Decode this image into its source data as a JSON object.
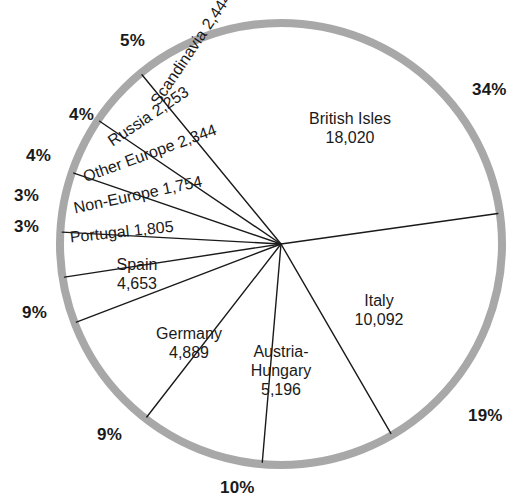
{
  "chart_data": {
    "type": "pie",
    "title": "",
    "subtitle": "",
    "xlabel": "",
    "ylabel": "",
    "total": 53450,
    "units": "count",
    "legend_position": "none",
    "grid": false,
    "categories": [
      "British Isles",
      "Italy",
      "Austria-Hungary",
      "Germany",
      "Spain",
      "Portugal",
      "Non-Europe",
      "Other Europe",
      "Russia",
      "Scandinavia"
    ],
    "values": [
      18020,
      10092,
      5196,
      4889,
      4653,
      1805,
      1754,
      2344,
      2253,
      2444
    ],
    "value_labels": [
      "18,020",
      "10,092",
      "5,196",
      "4,889",
      "4,653",
      "1,805",
      "1,754",
      "2,344",
      "2,253",
      "2,444"
    ],
    "percent_labels": [
      "34%",
      "19%",
      "10%",
      "9%",
      "9%",
      "3%",
      "3%",
      "4%",
      "4%",
      "5%"
    ],
    "percents": [
      34,
      19,
      10,
      9,
      9,
      3,
      3,
      4,
      4,
      5
    ],
    "slices": [
      {
        "name": "British Isles",
        "value": 18020,
        "value_label": "18,020",
        "percent_label": "34%",
        "label_line1": "British Isles",
        "label_line2": "18,020",
        "label_x": 350,
        "label_y": 129,
        "rotation": 0,
        "orientation": "horizontal",
        "pct_x": 472,
        "pct_y": 80,
        "start_deg": -8,
        "end_deg": -129.4
      },
      {
        "name": "Italy",
        "value": 10092,
        "value_label": "10,092",
        "percent_label": "19%",
        "label_line1": "Italy",
        "label_line2": "10,092",
        "label_x": 379,
        "label_y": 311,
        "rotation": 0,
        "orientation": "horizontal",
        "pct_x": 468,
        "pct_y": 406,
        "start_deg": 59.9,
        "end_deg": -8
      },
      {
        "name": "Austria-Hungary",
        "value": 5196,
        "value_label": "5,196",
        "percent_label": "10%",
        "label_line1": "Austria-",
        "label_line2": "Hungary",
        "label_line3": "5,196",
        "label_x": 281,
        "label_y": 371,
        "rotation": 0,
        "orientation": "horizontal",
        "pct_x": 220,
        "pct_y": 478,
        "start_deg": 94.9,
        "end_deg": 59.9
      },
      {
        "name": "Germany",
        "value": 4889,
        "value_label": "4,889",
        "percent_label": "9%",
        "label_line1": "Germany",
        "label_line2": "4,889",
        "label_x": 189,
        "label_y": 344,
        "rotation": 0,
        "orientation": "horizontal",
        "pct_x": 97,
        "pct_y": 425,
        "start_deg": 127.8,
        "end_deg": 94.9
      },
      {
        "name": "Spain",
        "value": 4653,
        "value_label": "4,653",
        "percent_label": "9%",
        "label_line1": "Spain",
        "label_line2": "4,653",
        "label_x": 137,
        "label_y": 275,
        "rotation": 0,
        "orientation": "horizontal",
        "pct_x": 22,
        "pct_y": 303,
        "start_deg": 159.1,
        "end_deg": 127.8
      },
      {
        "name": "Portugal",
        "value": 1805,
        "value_label": "1,805",
        "percent_label": "3%",
        "label_text": "Portugal 1,805",
        "label_x": 70,
        "label_y": 238,
        "rotation": -6,
        "orientation": "rotated",
        "pct_x": 14,
        "pct_y": 217,
        "start_deg": 171.3,
        "end_deg": 159.1
      },
      {
        "name": "Non-Europe",
        "value": 1754,
        "value_label": "1,754",
        "percent_label": "3%",
        "label_text": "Non-Europe 1,754",
        "label_x": 74,
        "label_y": 209,
        "rotation": -12,
        "orientation": "rotated",
        "pct_x": 14,
        "pct_y": 186,
        "start_deg": -176.9,
        "end_deg": 171.3
      },
      {
        "name": "Other Europe",
        "value": 2344,
        "value_label": "2,344",
        "percent_label": "4%",
        "label_text": "Other Europe 2,344",
        "label_x": 84,
        "label_y": 178,
        "rotation": -20,
        "orientation": "rotated",
        "pct_x": 26,
        "pct_y": 146,
        "start_deg": -161.1,
        "end_deg": -176.9
      },
      {
        "name": "Russia",
        "value": 2253,
        "value_label": "2,253",
        "percent_label": "4%",
        "label_text": "Russia 2,253",
        "label_x": 110,
        "label_y": 143,
        "rotation": -34,
        "orientation": "rotated",
        "pct_x": 69,
        "pct_y": 105,
        "start_deg": -145.9,
        "end_deg": -161.1
      },
      {
        "name": "Scandinavia",
        "value": 2444,
        "value_label": "2,444",
        "percent_label": "5%",
        "label_text": "Scandinavia 2,444",
        "label_x": 155,
        "label_y": 104,
        "rotation": -56,
        "orientation": "rotated",
        "pct_x": 120,
        "pct_y": 31,
        "start_deg": -129.4,
        "end_deg": -145.9
      }
    ],
    "geometry": {
      "cx": 281,
      "cy": 244,
      "radius": 221,
      "ring_width": 8
    },
    "colors": {
      "ring": "#a8a8a8",
      "line": "#1a1a1a",
      "text": "#1a1a1a",
      "background": "#ffffff"
    }
  }
}
